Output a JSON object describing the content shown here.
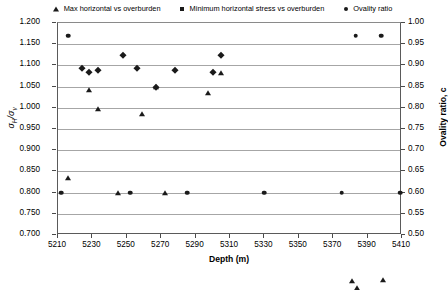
{
  "chart_data": {
    "type": "scatter",
    "title": "",
    "xlabel": "Depth (m)",
    "ylabel": "σH/σv",
    "ylabel_right": "Ovality ratio, c",
    "xlim": [
      5210,
      5410
    ],
    "ylim": [
      0.7,
      1.2
    ],
    "ylim_right": [
      0.5,
      1.0
    ],
    "grid": true,
    "legend_position": "top",
    "xticks": [
      "5210",
      "5230",
      "5250",
      "5270",
      "5290",
      "5310",
      "5330",
      "5350",
      "5370",
      "5390",
      "5410"
    ],
    "xtick_values": [
      5210,
      5230,
      5250,
      5270,
      5290,
      5310,
      5330,
      5350,
      5370,
      5390,
      5410
    ],
    "yticks_left": [
      "1.200",
      "1.150",
      "1.100",
      "1.050",
      "1.000",
      "0.950",
      "0.900",
      "0.850",
      "0.800",
      "0.750",
      "0.700"
    ],
    "ytick_left_values": [
      1.2,
      1.15,
      1.1,
      1.05,
      1.0,
      0.95,
      0.9,
      0.85,
      0.8,
      0.75,
      0.7
    ],
    "yticks_right": [
      "1.00",
      "0.95",
      "0.90",
      "0.85",
      "0.80",
      "0.75",
      "0.70",
      "0.65",
      "0.60",
      "0.55",
      "0.50"
    ],
    "ytick_right_values": [
      1.0,
      0.95,
      0.9,
      0.85,
      0.8,
      0.75,
      0.7,
      0.65,
      0.6,
      0.55,
      0.5
    ],
    "series": [
      {
        "name": "Max horizontal vs overburden",
        "marker": "triangle",
        "axis": "left",
        "color": "#1a1a1a",
        "points": [
          {
            "x": 5216,
            "y": 0.835
          },
          {
            "x": 5228,
            "y": 1.043
          },
          {
            "x": 5233,
            "y": 0.998
          },
          {
            "x": 5245,
            "y": 0.8
          },
          {
            "x": 5259,
            "y": 0.985
          },
          {
            "x": 5267,
            "y": 1.048
          },
          {
            "x": 5272,
            "y": 0.8
          },
          {
            "x": 5297,
            "y": 1.035
          },
          {
            "x": 5305,
            "y": 1.083
          },
          {
            "x": 5381,
            "y": 0.592
          },
          {
            "x": 5384,
            "y": 0.575
          },
          {
            "x": 5399,
            "y": 0.595
          }
        ]
      },
      {
        "name": "Minimum horizontal stress vs overburden",
        "marker": "diamond",
        "axis": "left",
        "color": "#1a1a1a",
        "points": [
          {
            "x": 5224,
            "y": 1.095
          },
          {
            "x": 5228,
            "y": 1.085
          },
          {
            "x": 5233,
            "y": 1.09
          },
          {
            "x": 5248,
            "y": 1.125
          },
          {
            "x": 5256,
            "y": 1.095
          },
          {
            "x": 5267,
            "y": 1.05
          },
          {
            "x": 5278,
            "y": 1.09
          },
          {
            "x": 5300,
            "y": 1.085
          },
          {
            "x": 5305,
            "y": 1.125
          }
        ]
      },
      {
        "name": "Ovality ratio",
        "marker": "circle",
        "axis": "right",
        "color": "#1a1a1a",
        "points": [
          {
            "x": 5216,
            "y": 0.97
          },
          {
            "x": 5212,
            "y": 0.6
          },
          {
            "x": 5252,
            "y": 0.6
          },
          {
            "x": 5285,
            "y": 0.6
          },
          {
            "x": 5330,
            "y": 0.6
          },
          {
            "x": 5375,
            "y": 0.6
          },
          {
            "x": 5383,
            "y": 0.97
          },
          {
            "x": 5398,
            "y": 0.97
          },
          {
            "x": 5409,
            "y": 0.6
          }
        ]
      }
    ]
  },
  "legend": {
    "entries": [
      {
        "label": "Max horizontal vs overburden",
        "marker": "triangle-marker"
      },
      {
        "label": "Minimum horizontal stress vs overburden",
        "marker": "diamond-marker"
      },
      {
        "label": "Ovality ratio",
        "marker": "circle-marker"
      }
    ]
  },
  "axes": {
    "x_title": "Depth (m)",
    "y_left_title_main": "σ",
    "y_left_title_sub1": "H",
    "y_left_title_slash": "/σ",
    "y_left_title_sub2": "v",
    "y_right_title": "Ovality ratio, c"
  }
}
